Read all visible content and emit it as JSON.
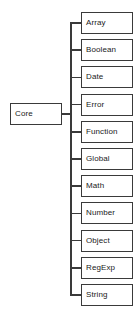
{
  "diagram": {
    "type": "tree",
    "title": "Core",
    "orientation": "horizontal-left-root",
    "colors": {
      "background": "#ffffff",
      "border": "#3a3a3a",
      "text": "#1a1a1a",
      "connector": "#3a3a3a"
    },
    "root": {
      "label": "Core",
      "name": "core"
    },
    "children": [
      {
        "label": "Array",
        "name": "array"
      },
      {
        "label": "Boolean",
        "name": "boolean"
      },
      {
        "label": "Date",
        "name": "date"
      },
      {
        "label": "Error",
        "name": "error"
      },
      {
        "label": "Function",
        "name": "function"
      },
      {
        "label": "Global",
        "name": "global"
      },
      {
        "label": "Math",
        "name": "math"
      },
      {
        "label": "Number",
        "name": "number"
      },
      {
        "label": "Object",
        "name": "object"
      },
      {
        "label": "RegExp",
        "name": "regexp"
      },
      {
        "label": "String",
        "name": "string"
      }
    ]
  }
}
